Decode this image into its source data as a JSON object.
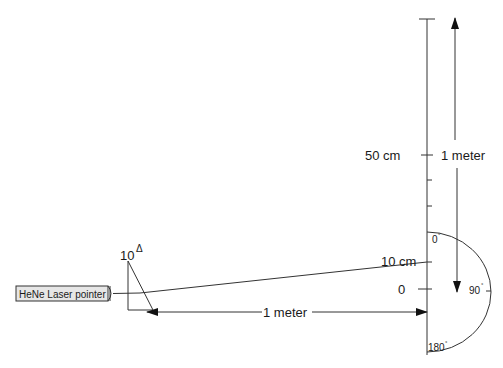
{
  "diagram": {
    "laser": {
      "label": "HeNe Laser pointer"
    },
    "prism": {
      "power": "10",
      "unit_symbol": "Δ"
    },
    "horizontal_distance": {
      "label": "1 meter"
    },
    "vertical_distance": {
      "label": "1 meter"
    },
    "ruler": {
      "labels": {
        "fifty": "50 cm",
        "ten": "10 cm",
        "zero": "0"
      }
    },
    "protractor": {
      "labels": {
        "deg0": "0",
        "deg90": "90",
        "deg180": "180",
        "degree_symbol": "°"
      }
    },
    "colors": {
      "line": "#333333",
      "laser_fill": "#e6e6e6",
      "background": "#ffffff"
    }
  }
}
